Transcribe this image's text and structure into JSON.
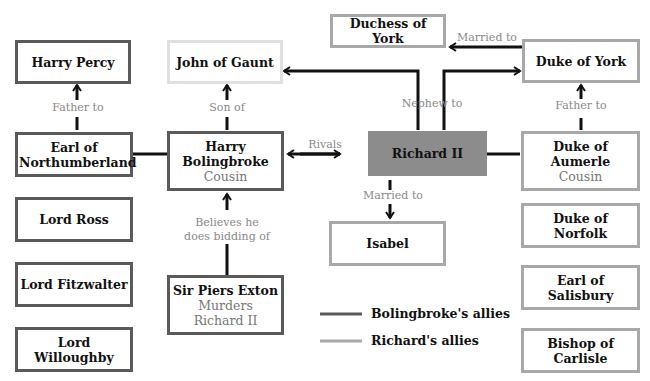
{
  "nodes": {
    "harry_percy": {
      "name": "Harry Percy"
    },
    "john_of_gaunt": {
      "name": "John of Gaunt"
    },
    "duchess_of_york": {
      "name": "Duchess of York"
    },
    "duke_of_york": {
      "name": "Duke of York"
    },
    "earl_of_northumberland": {
      "name": "Earl of Northumberland"
    },
    "harry_bolingbroke": {
      "name": "Harry Bolingbroke",
      "sub": "Cousin"
    },
    "richard_ii": {
      "name": "Richard II"
    },
    "duke_of_aumerle": {
      "name": "Duke of Aumerle",
      "sub": "Cousin"
    },
    "lord_ross": {
      "name": "Lord Ross"
    },
    "lord_fitzwalter": {
      "name": "Lord Fitzwalter"
    },
    "lord_willoughby": {
      "name": "Lord Willoughby"
    },
    "sir_piers_exton": {
      "name": "Sir Piers Exton",
      "sub": "Murders Richard II"
    },
    "isabel": {
      "name": "Isabel"
    },
    "duke_of_norfolk": {
      "name": "Duke of Norfolk"
    },
    "earl_of_salisbury": {
      "name": "Earl of Salisbury"
    },
    "bishop_of_carlisle": {
      "name": "Bishop of Carlisle"
    }
  },
  "edges": {
    "father_to_left": "Father to",
    "son_of": "Son of",
    "married_to_top": "Married to",
    "nephew_to": "Nephew to",
    "father_to_right": "Father to",
    "rivals": "Rivals",
    "married_to_isabel": "Married to",
    "believes_he": "Believes he",
    "does_bidding_of": "does bidding of"
  },
  "legend": {
    "items": [
      {
        "label": "Bolingbroke's allies",
        "color": "#5a5a5a"
      },
      {
        "label": "Richard's allies",
        "color": "#a8a8a8"
      }
    ]
  }
}
